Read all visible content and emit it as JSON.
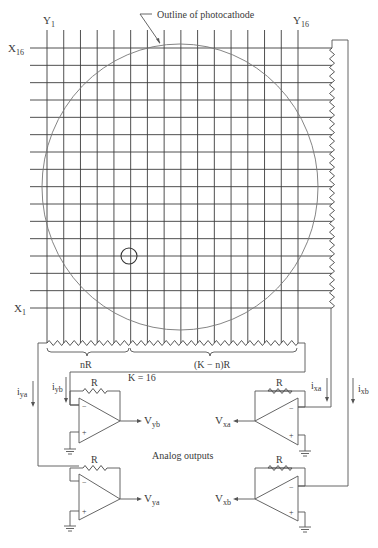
{
  "labels": {
    "outline_photocathode": "Outline of photocathode",
    "y_first": {
      "main": "Y",
      "sub": "1"
    },
    "y_last": {
      "main": "Y",
      "sub": "16"
    },
    "x_first": {
      "main": "X",
      "sub": "1"
    },
    "x_last": {
      "main": "X",
      "sub": "16"
    },
    "nR": "nR",
    "k_eq": "K = 16",
    "k_minus_n_R": "(K − n)R",
    "analog_outputs": "Analog outputs"
  },
  "currents": {
    "iya": {
      "main": "i",
      "sub": "ya"
    },
    "iyb": {
      "main": "i",
      "sub": "yb"
    },
    "ixa": {
      "main": "i",
      "sub": "xa"
    },
    "ixb": {
      "main": "i",
      "sub": "xb"
    }
  },
  "amplifiers": [
    {
      "id": "yb",
      "feedback": "R",
      "minus": "−",
      "plus": "+",
      "output": {
        "main": "V",
        "sub": "yb"
      }
    },
    {
      "id": "ya",
      "feedback": "R",
      "minus": "−",
      "plus": "+",
      "output": {
        "main": "V",
        "sub": "ya"
      }
    },
    {
      "id": "xa",
      "feedback": "R",
      "minus": "−",
      "plus": "+",
      "output": {
        "main": "V",
        "sub": "xa"
      }
    },
    {
      "id": "xb",
      "feedback": "R",
      "minus": "−",
      "plus": "+",
      "output": {
        "main": "V",
        "sub": "xb"
      }
    }
  ],
  "grid": {
    "columns": 16,
    "rows": 16,
    "K": 16
  }
}
